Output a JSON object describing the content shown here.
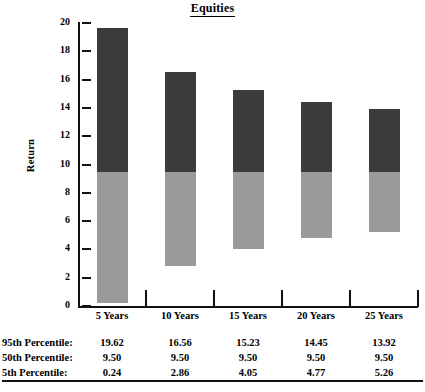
{
  "chart_data": {
    "type": "bar",
    "title": "Equities",
    "xlabel": "",
    "ylabel": "Return",
    "ylim": [
      0,
      20
    ],
    "ytick_step": 2,
    "yticks": [
      0,
      2,
      4,
      6,
      8,
      10,
      12,
      14,
      16,
      18,
      20
    ],
    "ytick_labels": [
      "0",
      "2",
      "4",
      "6",
      "8",
      "10",
      "12",
      "14",
      "16",
      "18",
      "20"
    ],
    "grid": false,
    "legend": "none",
    "categories": [
      "5 Years",
      "10 Years",
      "15 Years",
      "20 Years",
      "25 Years"
    ],
    "series": [
      {
        "name": "95th Percentile",
        "values": [
          19.62,
          16.56,
          15.23,
          14.45,
          13.92
        ],
        "labels": [
          "19.62",
          "16.56",
          "15.23",
          "14.45",
          "13.92"
        ]
      },
      {
        "name": "50th Percentile",
        "values": [
          9.5,
          9.5,
          9.5,
          9.5,
          9.5
        ],
        "labels": [
          "9.50",
          "9.50",
          "9.50",
          "9.50",
          "9.50"
        ]
      },
      {
        "name": "5th Percentile",
        "values": [
          0.24,
          2.86,
          4.05,
          4.77,
          5.26
        ],
        "labels": [
          "0.24",
          "2.86",
          "4.05",
          "4.77",
          "5.26"
        ]
      }
    ],
    "segment_colors": {
      "upper_50_to_95": "#3b3b3b",
      "lower_5_to_50": "#9a9a9a"
    }
  },
  "table": {
    "rows": [
      {
        "label": "95th Percentile:",
        "values": [
          "19.62",
          "16.56",
          "15.23",
          "14.45",
          "13.92"
        ]
      },
      {
        "label": "50th Percentile:",
        "values": [
          "9.50",
          "9.50",
          "9.50",
          "9.50",
          "9.50"
        ]
      },
      {
        "label": "5th Percentile:",
        "values": [
          "0.24",
          "2.86",
          "4.05",
          "4.77",
          "5.26"
        ]
      }
    ]
  }
}
